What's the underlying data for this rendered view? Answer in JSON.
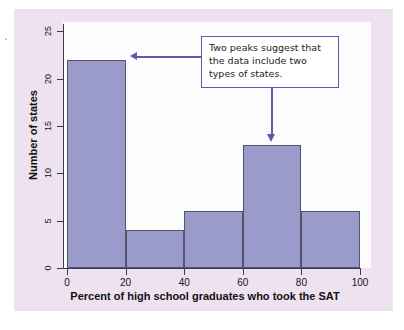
{
  "figure": {
    "panel_bg": "#eee2f0",
    "plot_bg": "#fdfcfd",
    "bar_fill": "#9a9acb",
    "bar_stroke": "#53536f",
    "annotation_color": "#5b5bb0"
  },
  "annotation": {
    "text": "Two peaks suggest that the data include two types of states.",
    "points_to": [
      "bar-0-20",
      "bar-60-80"
    ]
  },
  "chart_data": {
    "type": "bar",
    "title": "",
    "xlabel": "Percent of high school graduates who took the SAT",
    "ylabel": "Number of states",
    "xlim": [
      0,
      100
    ],
    "ylim": [
      0,
      26
    ],
    "xticks": [
      0,
      20,
      40,
      60,
      80,
      100
    ],
    "yticks": [
      0,
      5,
      10,
      15,
      20,
      25
    ],
    "xtick_labels": [
      "0",
      "20",
      "40",
      "60",
      "80",
      "100"
    ],
    "ytick_labels": [
      "0",
      "5",
      "10",
      "15",
      "20",
      "25"
    ],
    "grid": false,
    "legend": false,
    "bin_width": 20,
    "bin_edges": [
      0,
      20,
      40,
      60,
      80,
      100
    ],
    "categories": [
      "0-20",
      "20-40",
      "40-60",
      "60-80",
      "80-100"
    ],
    "values": [
      22,
      4,
      6,
      13,
      6
    ]
  }
}
